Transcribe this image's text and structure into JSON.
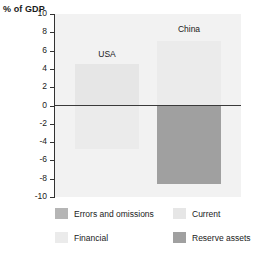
{
  "chart_data": {
    "type": "bar",
    "title": "",
    "subtitle": "",
    "ylabel": "% of GDP",
    "xlabel": "",
    "ylim": [
      -10,
      10
    ],
    "yticks": [
      10,
      8,
      6,
      4,
      2,
      0,
      -2,
      -4,
      -6,
      -8,
      -10
    ],
    "ytick_labels": [
      "10",
      "8",
      "6",
      "4",
      "2",
      "0",
      "-2",
      "-4",
      "-6",
      "-8",
      "-10"
    ],
    "grid": false,
    "legend_position": "bottom",
    "categories": [
      "USA",
      "China"
    ],
    "series": [
      {
        "name": "Errors and omissions",
        "color": "#b5b5b5",
        "values": [
          null,
          null
        ]
      },
      {
        "name": "Current",
        "color": "#e6e6e6",
        "values": [
          4.5,
          null
        ]
      },
      {
        "name": "Financial",
        "color": "#ebebeb",
        "values": [
          -4.8,
          7.0
        ]
      },
      {
        "name": "Reserve assets",
        "color": "#a0a0a0",
        "values": [
          null,
          -8.6
        ]
      }
    ],
    "bars": [
      {
        "group": "USA",
        "series": "Current",
        "value": 4.5,
        "color": "#e6e6e6"
      },
      {
        "group": "USA",
        "series": "Financial",
        "value": -4.8,
        "color": "#ebebeb"
      },
      {
        "group": "China",
        "series": "Financial",
        "value": 7.0,
        "color": "#ebebeb"
      },
      {
        "group": "China",
        "series": "Reserve assets",
        "value": -8.6,
        "color": "#a0a0a0"
      }
    ],
    "annotations": [
      {
        "text": "USA",
        "x": "USA",
        "y": 5.6
      },
      {
        "text": "China",
        "x": "China",
        "y": 8.4
      }
    ]
  },
  "axis": {
    "y_title": "% of GDP",
    "ticks": [
      {
        "label": "10",
        "value": 10
      },
      {
        "label": "8",
        "value": 8
      },
      {
        "label": "6",
        "value": 6
      },
      {
        "label": "4",
        "value": 4
      },
      {
        "label": "2",
        "value": 2
      },
      {
        "label": "0",
        "value": 0
      },
      {
        "label": "-2",
        "value": -2
      },
      {
        "label": "-4",
        "value": -4
      },
      {
        "label": "-6",
        "value": -6
      },
      {
        "label": "-8",
        "value": -8
      },
      {
        "label": "-10",
        "value": -10
      }
    ]
  },
  "groups": [
    {
      "label": "USA"
    },
    {
      "label": "China"
    }
  ],
  "legend": {
    "items": [
      {
        "label": "Errors and omissions",
        "color": "#b5b5b5"
      },
      {
        "label": "Current",
        "color": "#e6e6e6"
      },
      {
        "label": "Financial",
        "color": "#ebebeb"
      },
      {
        "label": "Reserve assets",
        "color": "#a0a0a0"
      }
    ]
  },
  "colors": {
    "plot_background": "#f2f2f2",
    "axis": "#333333",
    "zero_line": "#3a3a3a",
    "text": "#1a1a1a"
  }
}
